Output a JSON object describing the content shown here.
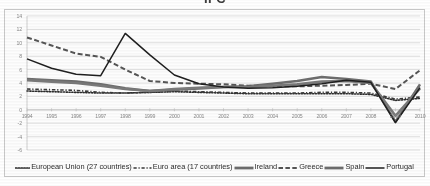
{
  "chart_data": {
    "type": "line",
    "title": "IFC",
    "xlabel": "",
    "ylabel": "",
    "x": [
      1994,
      1995,
      1996,
      1997,
      1998,
      1999,
      2000,
      2001,
      2002,
      2003,
      2004,
      2005,
      2006,
      2007,
      2008,
      2009,
      2010
    ],
    "xlim": [
      1994,
      2010
    ],
    "ylim": [
      -6,
      14
    ],
    "yticks": [
      14,
      12,
      10,
      8,
      6,
      4,
      2,
      0,
      -2,
      -4,
      -6
    ],
    "xticks": [
      "1994",
      "1995",
      "1996",
      "1997",
      "1998",
      "1999",
      "2000",
      "2001",
      "2002",
      "2003",
      "2004",
      "2005",
      "2006",
      "2007",
      "2008",
      "2009",
      "2010"
    ],
    "grid": true,
    "grid_axis": "y",
    "legend_position": "bottom",
    "series": [
      {
        "name": "European Union (27 countries)",
        "style": "dotted",
        "color": "#2b2b2b",
        "width": 1.6,
        "values": [
          2.8,
          2.7,
          2.6,
          2.5,
          2.5,
          2.6,
          2.7,
          2.6,
          2.5,
          2.4,
          2.4,
          2.4,
          2.4,
          2.4,
          2.3,
          1.4,
          1.7
        ]
      },
      {
        "name": "Euro area (17 countries)",
        "style": "dashdot",
        "color": "#3a3a3a",
        "width": 1.6,
        "values": [
          3.1,
          3.0,
          2.9,
          2.6,
          2.5,
          2.6,
          2.8,
          2.7,
          2.6,
          2.5,
          2.5,
          2.5,
          2.6,
          2.6,
          2.5,
          1.6,
          1.9
        ]
      },
      {
        "name": "Ireland",
        "style": "solid-thick",
        "color": "#6e6e6e",
        "width": 2.6,
        "values": [
          4.6,
          4.4,
          4.2,
          3.8,
          3.2,
          2.8,
          3.0,
          3.2,
          3.4,
          3.5,
          3.9,
          4.3,
          4.9,
          4.6,
          4.2,
          -1.8,
          3.8
        ]
      },
      {
        "name": "Greece",
        "style": "longdash",
        "color": "#555555",
        "width": 2.0,
        "values": [
          10.8,
          9.6,
          8.4,
          7.9,
          6.0,
          4.3,
          4.0,
          3.9,
          3.8,
          3.6,
          3.5,
          3.5,
          3.6,
          3.7,
          3.9,
          3.1,
          5.9
        ]
      },
      {
        "name": "Spain",
        "style": "solid-thick",
        "color": "#7a7a7a",
        "width": 2.6,
        "values": [
          4.4,
          4.2,
          4.0,
          3.6,
          3.1,
          2.8,
          3.1,
          3.3,
          3.4,
          3.4,
          3.6,
          3.8,
          4.2,
          4.3,
          4.0,
          -0.9,
          3.2
        ]
      },
      {
        "name": "Portugal",
        "style": "solid",
        "color": "#1f1f1f",
        "width": 1.5,
        "values": [
          7.6,
          6.2,
          5.3,
          5.1,
          11.4,
          8.2,
          5.2,
          3.9,
          3.4,
          3.2,
          3.3,
          3.5,
          3.9,
          4.4,
          4.1,
          -1.9,
          3.3
        ]
      }
    ]
  },
  "legend": {
    "items": [
      {
        "label": "European Union (27 countries)",
        "swatch": "dotted-swatch-icon"
      },
      {
        "label": "Euro area (17 countries)",
        "swatch": "dashdot-swatch-icon"
      },
      {
        "label": "Ireland",
        "swatch": "thick-line-swatch-icon"
      },
      {
        "label": "Greece",
        "swatch": "dashed-swatch-icon"
      },
      {
        "label": "Spain",
        "swatch": "thick-line-swatch-icon"
      },
      {
        "label": "Portugal",
        "swatch": "solid-line-swatch-icon"
      }
    ]
  }
}
